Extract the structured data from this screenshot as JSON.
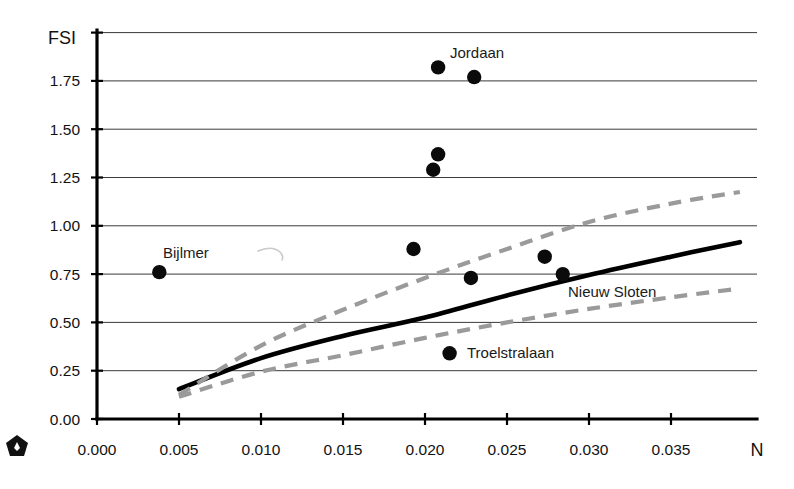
{
  "chart_data": {
    "type": "scatter",
    "title": "",
    "xlabel": "N",
    "ylabel": "FSI",
    "xlim": [
      0.0,
      0.0395
    ],
    "ylim": [
      0.0,
      2.0
    ],
    "grid": true,
    "legend_position": "none",
    "x_ticks": [
      "0.000",
      "0.005",
      "0.010",
      "0.015",
      "0.020",
      "0.025",
      "0.030",
      "0.035"
    ],
    "x_tick_values": [
      0.0,
      0.005,
      0.01,
      0.015,
      0.02,
      0.025,
      0.03,
      0.035
    ],
    "y_ticks": [
      "0.00",
      "0.25",
      "0.50",
      "0.75",
      "1.00",
      "1.25",
      "1.50",
      "1.75"
    ],
    "y_tick_values": [
      0.0,
      0.25,
      0.5,
      0.75,
      1.0,
      1.25,
      1.5,
      1.75
    ],
    "y_gridline_values": [
      0.25,
      0.5,
      0.75,
      1.0,
      1.25,
      1.5,
      1.75,
      2.0
    ],
    "points": [
      {
        "x": 0.0038,
        "y": 0.76,
        "label": "Bijlmer"
      },
      {
        "x": 0.0193,
        "y": 0.88,
        "label": ""
      },
      {
        "x": 0.0205,
        "y": 1.29,
        "label": ""
      },
      {
        "x": 0.0208,
        "y": 1.37,
        "label": ""
      },
      {
        "x": 0.0208,
        "y": 1.82,
        "label": "Jordaan"
      },
      {
        "x": 0.0215,
        "y": 0.34,
        "label": "Troelstralaan"
      },
      {
        "x": 0.023,
        "y": 1.77,
        "label": ""
      },
      {
        "x": 0.0228,
        "y": 0.73,
        "label": ""
      },
      {
        "x": 0.0273,
        "y": 0.84,
        "label": ""
      },
      {
        "x": 0.0284,
        "y": 0.75,
        "label": "Nieuw Sloten"
      }
    ],
    "series": [
      {
        "name": "regression",
        "style": "solid-black",
        "x": [
          0.005,
          0.01,
          0.015,
          0.02,
          0.025,
          0.03,
          0.035,
          0.0392
        ],
        "values": [
          0.155,
          0.315,
          0.43,
          0.525,
          0.64,
          0.745,
          0.84,
          0.915
        ]
      },
      {
        "name": "upper-confidence-band",
        "style": "dashed-gray",
        "x": [
          0.005,
          0.01,
          0.015,
          0.02,
          0.025,
          0.03,
          0.035,
          0.0392
        ],
        "values": [
          0.125,
          0.38,
          0.565,
          0.73,
          0.88,
          1.02,
          1.115,
          1.175
        ]
      },
      {
        "name": "lower-confidence-band",
        "style": "dashed-gray",
        "x": [
          0.005,
          0.01,
          0.015,
          0.02,
          0.025,
          0.03,
          0.035,
          0.0392
        ],
        "values": [
          0.115,
          0.245,
          0.33,
          0.42,
          0.5,
          0.57,
          0.63,
          0.675
        ]
      }
    ],
    "annotations": [
      {
        "text": "Bijlmer",
        "x_px": 163,
        "y_px": 258
      },
      {
        "text": "Jordaan",
        "x_px": 450,
        "y_px": 58
      },
      {
        "text": "Nieuw Sloten",
        "x_px": 568,
        "y_px": 297
      },
      {
        "text": "Troelstralaan",
        "x_px": 467,
        "y_px": 358
      }
    ]
  },
  "figure": {
    "axis_x_title": "N",
    "axis_y_title": "FSI",
    "badge": "pentagon-badge"
  }
}
